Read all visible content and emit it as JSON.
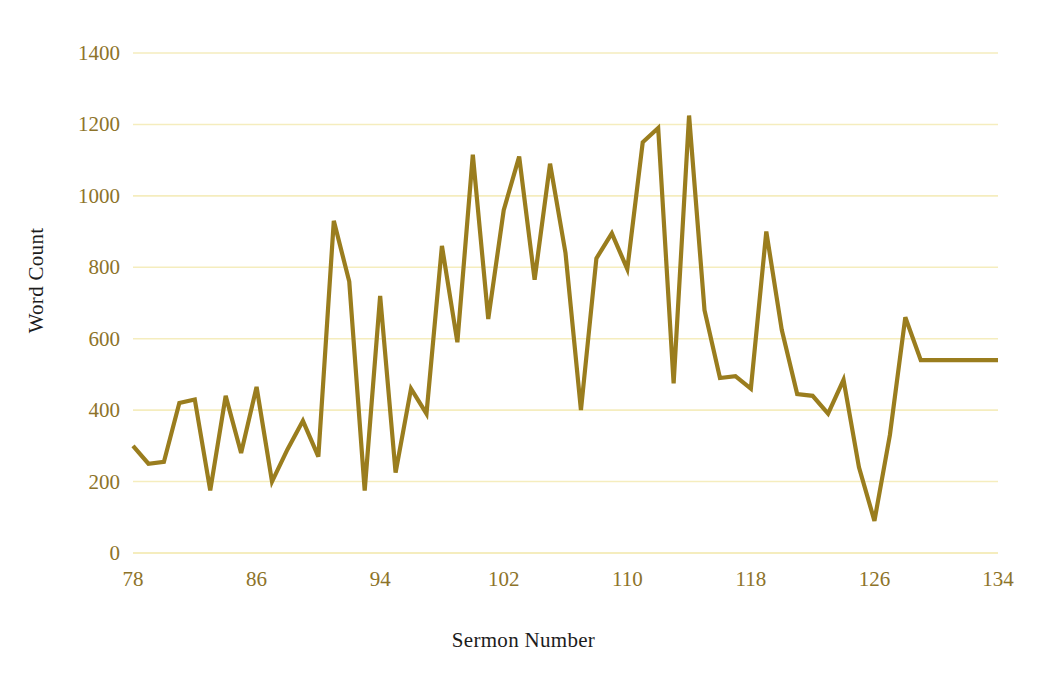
{
  "chart_data": {
    "type": "line",
    "title": "",
    "xlabel": "Sermon Number",
    "ylabel": "Word Count",
    "xlim": [
      78,
      134
    ],
    "ylim": [
      0,
      1400
    ],
    "y_tick_step": 200,
    "x_tick_step": 8,
    "grid": true,
    "legend": false,
    "line_color": "#9a7d1e",
    "grid_color": "#f5edbe",
    "tick_label_color": "#8d7329",
    "axis_title_color": "#1c1c1c",
    "background_color": "#ffffff",
    "y_ticks": [
      "0",
      "200",
      "400",
      "600",
      "800",
      "1000",
      "1200",
      "1400"
    ],
    "x_ticks": [
      "78",
      "86",
      "94",
      "102",
      "110",
      "118",
      "126",
      "134"
    ],
    "series": [
      {
        "name": "Word Count",
        "x": [
          78,
          79,
          80,
          81,
          82,
          83,
          84,
          85,
          86,
          87,
          88,
          89,
          90,
          91,
          92,
          93,
          94,
          95,
          96,
          97,
          98,
          99,
          100,
          101,
          102,
          103,
          104,
          105,
          106,
          107,
          108,
          109,
          110,
          111,
          112,
          113,
          114,
          115,
          116,
          117,
          118,
          119,
          120,
          121,
          122,
          123,
          124,
          125,
          126,
          127,
          128,
          129,
          130,
          131,
          132,
          133,
          134
        ],
        "values": [
          300,
          250,
          255,
          420,
          430,
          175,
          440,
          280,
          465,
          200,
          290,
          370,
          270,
          930,
          760,
          175,
          720,
          225,
          460,
          390,
          860,
          590,
          1115,
          655,
          960,
          1110,
          765,
          1090,
          840,
          400,
          825,
          895,
          795,
          1150,
          1190,
          475,
          1225,
          680,
          490,
          495,
          460,
          900,
          625,
          445,
          440,
          390,
          485,
          240,
          90,
          330,
          660,
          540,
          540,
          540,
          540,
          540,
          540
        ]
      }
    ]
  },
  "axes": {
    "y_title": "Word Count",
    "x_title": "Sermon Number"
  }
}
